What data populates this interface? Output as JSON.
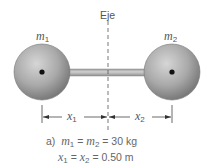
{
  "diagram": {
    "axis_label": "Eje",
    "mass1_label": "m",
    "mass1_sub": "1",
    "mass2_label": "m",
    "mass2_sub": "2",
    "x1_label": "x",
    "x1_sub": "1",
    "x2_label": "x",
    "x2_sub": "2",
    "caption": {
      "prefix": "a)",
      "line1_m1": "m",
      "line1_m1_sub": "1",
      "line1_eq1": " = ",
      "line1_m2": "m",
      "line1_m2_sub": "2",
      "line1_rest": " = 30 kg",
      "line2_x1": "x",
      "line2_x1_sub": "1",
      "line2_eq1": " = ",
      "line2_x2": "x",
      "line2_x2_sub": "2",
      "line2_rest": " = 0.50 m"
    },
    "colors": {
      "sphere": "#a8a8a8",
      "rod": "#b5b5b5",
      "line": "#444444"
    }
  }
}
